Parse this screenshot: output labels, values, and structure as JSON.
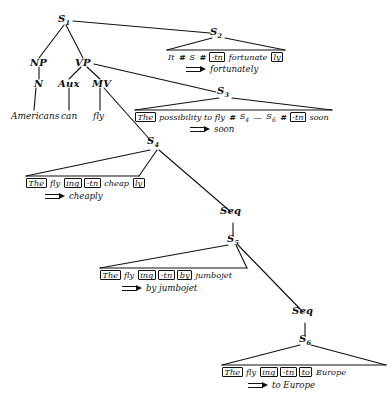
{
  "diagram": {
    "ink_color": "#111111",
    "background": "#ffffff"
  },
  "nodes": {
    "s1": "S",
    "s1_sub": "1",
    "s2": "S",
    "s2_sub": "2",
    "s3": "S",
    "s3_sub": "3",
    "s4": "S",
    "s4_sub": "4",
    "s5": "S",
    "s5_sub": "5",
    "s6": "S",
    "s6_sub": "6",
    "np": "NP",
    "n": "N",
    "vp": "VP",
    "aux": "Aux",
    "mv": "MV",
    "seq_upper": "Seq",
    "seq_lower": "Seq"
  },
  "terminals": {
    "americans": "Americans",
    "can": "can",
    "fly": "fly"
  },
  "strings": {
    "s2": {
      "tokens": [
        {
          "text": "It",
          "style": "plain"
        },
        {
          "text": "#",
          "style": "hash"
        },
        {
          "text": "S",
          "style": "plain"
        },
        {
          "text": "#",
          "style": "hash"
        },
        {
          "text": "-tn",
          "style": "bracket"
        },
        {
          "text": "fortunate",
          "style": "plain"
        },
        {
          "text": "ly",
          "style": "bracket"
        }
      ],
      "output": "fortunately"
    },
    "s3": {
      "tokens": [
        {
          "text": "The",
          "style": "bracket"
        },
        {
          "text": "possibility to fly",
          "style": "plain"
        },
        {
          "text": "#",
          "style": "hash"
        },
        {
          "text": "S",
          "style": "plain",
          "sub": "4"
        },
        {
          "text": "—",
          "style": "plain"
        },
        {
          "text": "S",
          "style": "plain",
          "sub": "6"
        },
        {
          "text": "#",
          "style": "hash"
        },
        {
          "text": "-tn",
          "style": "bracket"
        },
        {
          "text": "soon",
          "style": "plain"
        }
      ],
      "output": "soon"
    },
    "s4": {
      "tokens": [
        {
          "text": "The",
          "style": "bracket"
        },
        {
          "text": "fly",
          "style": "plain"
        },
        {
          "text": "ing",
          "style": "bracket"
        },
        {
          "text": "-tn",
          "style": "bracket"
        },
        {
          "text": "cheap",
          "style": "plain"
        },
        {
          "text": "ly",
          "style": "bracket"
        }
      ],
      "output": "cheaply"
    },
    "s5": {
      "tokens": [
        {
          "text": "The",
          "style": "bracket"
        },
        {
          "text": "fly",
          "style": "plain"
        },
        {
          "text": "ing",
          "style": "bracket"
        },
        {
          "text": "-tn",
          "style": "bracket"
        },
        {
          "text": "by",
          "style": "bracket"
        },
        {
          "text": "jumbojet",
          "style": "plain"
        }
      ],
      "output": "by jumbojet"
    },
    "s6": {
      "tokens": [
        {
          "text": "The",
          "style": "bracket"
        },
        {
          "text": "fly",
          "style": "plain"
        },
        {
          "text": "ing",
          "style": "bracket"
        },
        {
          "text": "-tn",
          "style": "bracket"
        },
        {
          "text": "to",
          "style": "bracket"
        },
        {
          "text": "Europe",
          "style": "plain"
        }
      ],
      "output": "to Europe"
    }
  },
  "edges": [
    {
      "name": "s1-np",
      "x1": 64,
      "y1": 25,
      "x2": 39,
      "y2": 58
    },
    {
      "name": "s1-vp",
      "x1": 66,
      "y1": 25,
      "x2": 83,
      "y2": 58
    },
    {
      "name": "s1-s2",
      "x1": 73,
      "y1": 21,
      "x2": 210,
      "y2": 33
    },
    {
      "name": "np-n",
      "x1": 39,
      "y1": 67,
      "x2": 39,
      "y2": 79
    },
    {
      "name": "n-americans",
      "x1": 36,
      "y1": 88,
      "x2": 34,
      "y2": 110
    },
    {
      "name": "vp-aux",
      "x1": 81,
      "y1": 67,
      "x2": 69,
      "y2": 79
    },
    {
      "name": "vp-mv",
      "x1": 87,
      "y1": 67,
      "x2": 100,
      "y2": 79
    },
    {
      "name": "vp-s3",
      "x1": 94,
      "y1": 64,
      "x2": 216,
      "y2": 92
    },
    {
      "name": "aux-can",
      "x1": 69,
      "y1": 88,
      "x2": 69,
      "y2": 110
    },
    {
      "name": "mv-fly",
      "x1": 100,
      "y1": 88,
      "x2": 100,
      "y2": 110
    },
    {
      "name": "mv-s4",
      "x1": 104,
      "y1": 88,
      "x2": 152,
      "y2": 142
    },
    {
      "name": "s2-left",
      "x1": 212,
      "y1": 38,
      "x2": 167,
      "y2": 50
    },
    {
      "name": "s2-right",
      "x1": 225,
      "y1": 38,
      "x2": 285,
      "y2": 50
    },
    {
      "name": "s2-baseline",
      "x1": 167,
      "y1": 50,
      "x2": 285,
      "y2": 50
    },
    {
      "name": "s3-left",
      "x1": 219,
      "y1": 98,
      "x2": 135,
      "y2": 110
    },
    {
      "name": "s3-right",
      "x1": 232,
      "y1": 98,
      "x2": 332,
      "y2": 110
    },
    {
      "name": "s3-baseline",
      "x1": 135,
      "y1": 110,
      "x2": 332,
      "y2": 110
    },
    {
      "name": "s4-left",
      "x1": 150,
      "y1": 150,
      "x2": 26,
      "y2": 176
    },
    {
      "name": "s4-right",
      "x1": 157,
      "y1": 150,
      "x2": 139,
      "y2": 176
    },
    {
      "name": "s4-baseline",
      "x1": 26,
      "y1": 176,
      "x2": 139,
      "y2": 176
    },
    {
      "name": "s4-seq",
      "x1": 159,
      "y1": 150,
      "x2": 231,
      "y2": 212
    },
    {
      "name": "seq1-s5",
      "x1": 233,
      "y1": 223,
      "x2": 233,
      "y2": 235
    },
    {
      "name": "s5-left",
      "x1": 228,
      "y1": 245,
      "x2": 100,
      "y2": 268
    },
    {
      "name": "s5-right",
      "x1": 236,
      "y1": 245,
      "x2": 247,
      "y2": 268
    },
    {
      "name": "s5-baseline",
      "x1": 100,
      "y1": 268,
      "x2": 247,
      "y2": 268
    },
    {
      "name": "s5-seq",
      "x1": 238,
      "y1": 245,
      "x2": 303,
      "y2": 312
    },
    {
      "name": "seq2-s6",
      "x1": 305,
      "y1": 323,
      "x2": 305,
      "y2": 335
    },
    {
      "name": "s6-left",
      "x1": 300,
      "y1": 345,
      "x2": 222,
      "y2": 365
    },
    {
      "name": "s6-right",
      "x1": 311,
      "y1": 345,
      "x2": 386,
      "y2": 365
    },
    {
      "name": "s6-baseline",
      "x1": 222,
      "y1": 365,
      "x2": 386,
      "y2": 365
    }
  ]
}
